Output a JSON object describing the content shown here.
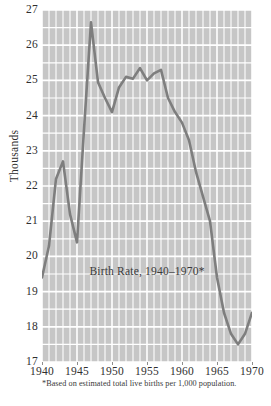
{
  "chart_data": {
    "type": "line",
    "title": "Birth Rate, 1940–1970*",
    "xlabel": "",
    "ylabel": "Thousands",
    "footnote": "*Based on estimated total live births per 1,000 population.",
    "xlim": [
      1940,
      1970
    ],
    "ylim": [
      17,
      27
    ],
    "xticks": [
      1940,
      1945,
      1950,
      1955,
      1960,
      1965,
      1970
    ],
    "xticklabels": [
      "1940",
      "1945",
      "1950",
      "1955",
      "1960",
      "1965",
      "1970"
    ],
    "yticks": [
      17,
      18,
      19,
      20,
      21,
      22,
      23,
      24,
      25,
      26,
      27
    ],
    "yticklabels": [
      "17",
      "18",
      "19",
      "20",
      "21",
      "22",
      "23",
      "24",
      "25",
      "26",
      "27"
    ],
    "grid": true,
    "grid_major_y_step": 1,
    "grid_minor_y_step": 0.5,
    "grid_minor_x_step": 1,
    "legend": "none",
    "x": [
      1940,
      1941,
      1942,
      1943,
      1944,
      1945,
      1946,
      1947,
      1948,
      1949,
      1950,
      1951,
      1952,
      1953,
      1954,
      1955,
      1956,
      1957,
      1958,
      1959,
      1960,
      1961,
      1962,
      1963,
      1964,
      1965,
      1966,
      1967,
      1968,
      1969,
      1970
    ],
    "values": [
      19.4,
      20.3,
      22.2,
      22.7,
      21.2,
      20.4,
      23.6,
      26.65,
      24.95,
      24.5,
      24.1,
      24.8,
      25.1,
      25.05,
      25.35,
      25.0,
      25.2,
      25.3,
      24.5,
      24.1,
      23.8,
      23.3,
      22.4,
      21.7,
      21.0,
      19.4,
      18.4,
      17.8,
      17.5,
      17.8,
      18.4
    ],
    "series": [
      {
        "name": "Birth rate per 1,000 population",
        "color": "#7e7e7e",
        "values": [
          19.4,
          20.3,
          22.2,
          22.7,
          21.2,
          20.4,
          23.6,
          26.65,
          24.95,
          24.5,
          24.1,
          24.8,
          25.1,
          25.05,
          25.35,
          25.0,
          25.2,
          25.3,
          24.5,
          24.1,
          23.8,
          23.3,
          22.4,
          21.7,
          21.0,
          19.4,
          18.4,
          17.8,
          17.5,
          17.8,
          18.4
        ]
      }
    ],
    "colors": {
      "line": "#7e7e7e",
      "plot_background": "#c6c6c6",
      "gridline": "#ffffff",
      "text": "#2f2f2f",
      "page_background": "#ffffff"
    }
  }
}
